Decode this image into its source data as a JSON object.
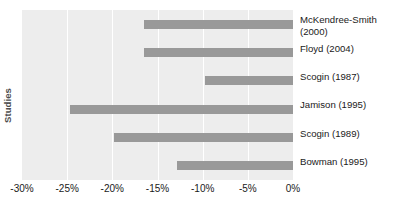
{
  "chart_data": {
    "type": "bar",
    "orientation": "horizontal",
    "title": "",
    "xlabel": "",
    "ylabel": "Studies",
    "categories": [
      "McKendree-Smith (2000)",
      "Floyd (2004)",
      "Scogin (1987)",
      "Jamison (1995)",
      "Scogin (1989)",
      "Bowman (1995)"
    ],
    "values": [
      -16.5,
      -16.5,
      -9.8,
      -24.7,
      -19.8,
      -12.9
    ],
    "xlim": [
      -30,
      0
    ],
    "xtick_labels": [
      "-30%",
      "-25%",
      "-20%",
      "-15%",
      "-10%",
      "-5%",
      "0%"
    ],
    "xtick_values": [
      -30,
      -25,
      -20,
      -15,
      -10,
      -5,
      0
    ],
    "grid": true,
    "legend": false,
    "bar_color": "#999999",
    "plot_background": "#ededed",
    "gridline_color": "#ffffff"
  },
  "axis": {
    "y_title": "Studies"
  }
}
